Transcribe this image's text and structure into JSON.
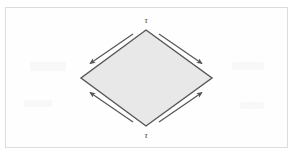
{
  "figure": {
    "type": "geometry-diagram",
    "background_color": "#ffffff",
    "frame": {
      "border_color": "#dcdcdc",
      "fill_color": "#fefefe"
    },
    "shape": {
      "name": "rhombus",
      "fill_color": "#e8e8e8",
      "stroke_color": "#555555",
      "stroke_width": 1.4,
      "vertices": {
        "top": {
          "x": 146,
          "y": 30
        },
        "right": {
          "x": 212,
          "y": 78
        },
        "bottom": {
          "x": 146,
          "y": 126
        },
        "left": {
          "x": 81,
          "y": 78
        }
      }
    },
    "labels": [
      {
        "name": "top-vertex-label",
        "text": "τ",
        "position": "top",
        "x": 146,
        "y": 20
      },
      {
        "name": "bottom-vertex-label",
        "text": "τ",
        "position": "bottom",
        "x": 146,
        "y": 135
      }
    ],
    "arrows": [
      {
        "name": "arrow-upper-left",
        "direction": "down-left",
        "from": {
          "x": 133,
          "y": 34
        },
        "to": {
          "x": 89,
          "y": 64
        },
        "color": "#555555"
      },
      {
        "name": "arrow-upper-right",
        "direction": "down-right",
        "from": {
          "x": 159,
          "y": 34
        },
        "to": {
          "x": 203,
          "y": 64
        },
        "color": "#555555"
      },
      {
        "name": "arrow-lower-left",
        "direction": "up-left",
        "from": {
          "x": 133,
          "y": 122
        },
        "to": {
          "x": 89,
          "y": 92
        },
        "color": "#555555"
      },
      {
        "name": "arrow-lower-right",
        "direction": "up-right",
        "from": {
          "x": 159,
          "y": 122
        },
        "to": {
          "x": 203,
          "y": 92
        },
        "color": "#555555"
      }
    ]
  }
}
